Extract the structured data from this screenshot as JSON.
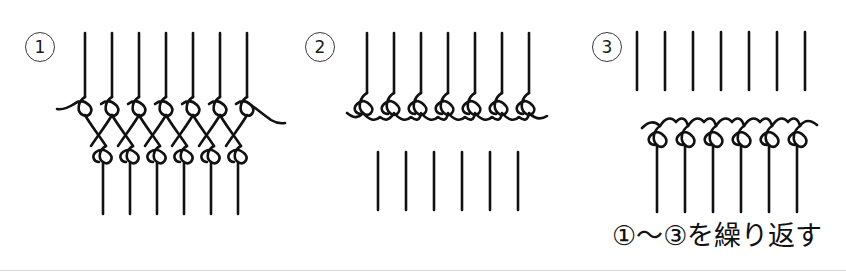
{
  "document": {
    "type": "craft-instruction-diagram",
    "subject": "netting / macrame knot sequence",
    "background_color": "#ffffff",
    "ink_color": "#111111",
    "width": 846,
    "height": 277
  },
  "steps": [
    {
      "number": "1",
      "badge_label": "①",
      "badge_digit": "1",
      "description": "Seven vertical strands descend into a row of seven teardrop loops; strands cross below forming a lattice into a second row of six loops with six strands continuing down.",
      "upper_strand_count": 7,
      "upper_loop_count": 7,
      "lower_loop_count": 6,
      "lower_strand_count": 6
    },
    {
      "number": "2",
      "badge_label": "②",
      "badge_digit": "2",
      "description": "Seven vertical strands descend into seven teardrop loops resting on a scalloped horizontal cord; a separate group of six short vertical strands sits below.",
      "upper_strand_count": 7,
      "loop_count": 7,
      "detached_strand_count": 6
    },
    {
      "number": "3",
      "badge_label": "③",
      "badge_digit": "3",
      "description": "A group of seven short vertical strands sits above a scalloped cord that arcs upward between six downward-hanging teardrop loops, each continuing into a long vertical strand.",
      "detached_strand_count": 7,
      "loop_count": 6,
      "lower_strand_count": 6
    }
  ],
  "caption": {
    "text": "①～③を繰り返す",
    "meaning": "Repeat steps 1 through 3"
  }
}
